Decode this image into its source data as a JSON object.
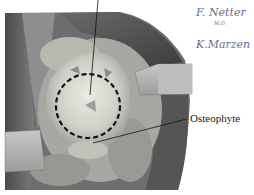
{
  "figure": {
    "type": "surgical-illustration",
    "labels": [
      {
        "id": "osteophyte",
        "text": "Osteophyte"
      }
    ],
    "signatures": [
      {
        "text": "F. Netter",
        "sub": "M.D."
      },
      {
        "text": "K.Marzen"
      }
    ],
    "colors": {
      "tissue_dark": "#5a5a5a",
      "tissue_mid": "#8a8a8a",
      "bone_light": "#d8d8d0",
      "retractor": "#b5b5b5",
      "signature": "#6a6a8a"
    }
  }
}
